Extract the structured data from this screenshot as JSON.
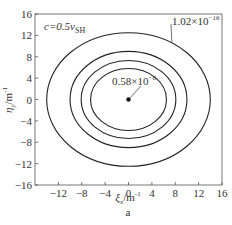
{
  "chart_data": {
    "type": "contour",
    "title": "",
    "annotation_top_left": {
      "text": "c=0.5",
      "sub": "SH",
      "var_v": "v"
    },
    "xlabel": {
      "symbol": "ξ",
      "sub": "x",
      "unit": "/m",
      "sup": "-1"
    },
    "ylabel": {
      "symbol": "η",
      "sub": "y",
      "unit": "/m",
      "sup": "-1"
    },
    "caption": "a",
    "xlim": [
      -16,
      16
    ],
    "ylim": [
      -16,
      16
    ],
    "xticks": [
      -12,
      -8,
      -4,
      0,
      4,
      8,
      12,
      16
    ],
    "yticks": [
      16,
      12,
      8,
      4,
      0,
      -4,
      -8,
      -12,
      -16
    ],
    "x_tick_labels": [
      "−12",
      "−8",
      "−4",
      "0",
      "4",
      "8",
      "12",
      "16"
    ],
    "y_tick_labels": [
      "16",
      "12",
      "8",
      "4",
      "0",
      "−4",
      "−8",
      "−12",
      "−16"
    ],
    "y_left_extra_label": "−16",
    "grid": false,
    "contours": [
      {
        "level": "outer",
        "semi_x": 14.0,
        "semi_y": 12.5
      },
      {
        "level": "second",
        "semi_x": 10.0,
        "semi_y": 9.0
      },
      {
        "level": "third",
        "semi_x": 8.1,
        "semi_y": 7.3
      },
      {
        "level": "inner",
        "semi_x": 6.5,
        "semi_y": 5.8
      }
    ],
    "center_point": {
      "x": 0,
      "y": 0
    },
    "labels": [
      {
        "text_mant": "1.02×10",
        "exp": "−16",
        "points_to": "outer"
      },
      {
        "text_mant": "0.58×10",
        "exp": "−8",
        "points_to": "center"
      }
    ]
  }
}
